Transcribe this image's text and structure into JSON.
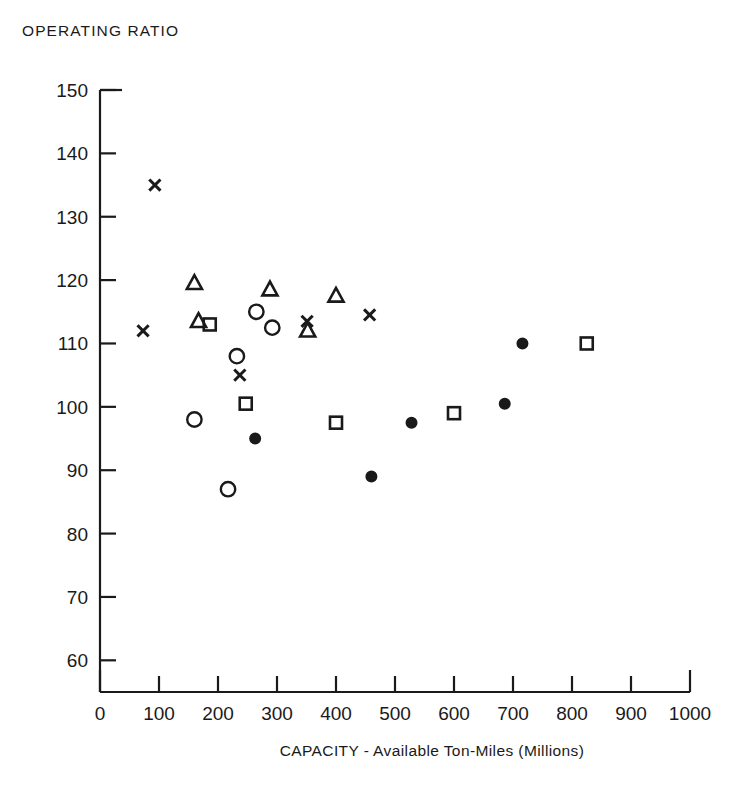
{
  "chart_data": {
    "type": "scatter",
    "title": "OPERATING RATIO",
    "xlabel": "CAPACITY - Available Ton-Miles (Millions)",
    "ylabel": "OPERATING RATIO",
    "xlim": [
      0,
      1000
    ],
    "ylim": [
      55,
      150
    ],
    "xticks": [
      0,
      100,
      200,
      300,
      400,
      500,
      600,
      700,
      800,
      900,
      1000
    ],
    "yticks": [
      60,
      70,
      80,
      90,
      100,
      110,
      120,
      130,
      140,
      150
    ],
    "grid": false,
    "legend": "none",
    "series": [
      {
        "name": "x-marker",
        "marker": "x",
        "fill": "none",
        "points": [
          {
            "x": 93,
            "y": 135
          },
          {
            "x": 73,
            "y": 112
          },
          {
            "x": 237,
            "y": 105
          },
          {
            "x": 351,
            "y": 113.5
          },
          {
            "x": 457,
            "y": 114.5
          }
        ]
      },
      {
        "name": "open-triangle",
        "marker": "triangle",
        "fill": "none",
        "points": [
          {
            "x": 160,
            "y": 119.5
          },
          {
            "x": 167,
            "y": 113.5
          },
          {
            "x": 288,
            "y": 118.5
          },
          {
            "x": 352,
            "y": 112
          },
          {
            "x": 400,
            "y": 117.5
          }
        ]
      },
      {
        "name": "open-square",
        "marker": "square",
        "fill": "none",
        "points": [
          {
            "x": 186,
            "y": 113
          },
          {
            "x": 247,
            "y": 100.5
          },
          {
            "x": 400,
            "y": 97.5
          },
          {
            "x": 600,
            "y": 99
          },
          {
            "x": 825,
            "y": 110
          }
        ]
      },
      {
        "name": "open-circle",
        "marker": "circle",
        "fill": "none",
        "points": [
          {
            "x": 160,
            "y": 98
          },
          {
            "x": 217,
            "y": 87
          },
          {
            "x": 232,
            "y": 108
          },
          {
            "x": 265,
            "y": 115
          },
          {
            "x": 292,
            "y": 112.5
          }
        ]
      },
      {
        "name": "filled-circle",
        "marker": "circle",
        "fill": "solid",
        "points": [
          {
            "x": 263,
            "y": 95
          },
          {
            "x": 460,
            "y": 89
          },
          {
            "x": 528,
            "y": 97.5
          },
          {
            "x": 686,
            "y": 100.5
          },
          {
            "x": 716,
            "y": 110
          }
        ]
      }
    ]
  },
  "axes": {
    "y_tick_labels": [
      "150",
      "140",
      "130",
      "120",
      "110",
      "100",
      "90",
      "80",
      "70",
      "60"
    ],
    "x_tick_labels": [
      "0",
      "100",
      "200",
      "300",
      "400",
      "500",
      "600",
      "700",
      "800",
      "900",
      "1000"
    ]
  }
}
